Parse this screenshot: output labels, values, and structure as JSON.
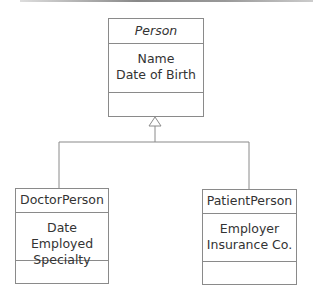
{
  "diagram": {
    "type": "UML class diagram (generalization)",
    "classes": [
      {
        "id": "person",
        "name": "Person",
        "abstract": true,
        "attributes": [
          "Name",
          "Date of Birth"
        ],
        "operations": []
      },
      {
        "id": "doctor",
        "name": "DoctorPerson",
        "abstract": false,
        "attributes": [
          "Date Employed",
          "Specialty"
        ],
        "operations": []
      },
      {
        "id": "patient",
        "name": "PatientPerson",
        "abstract": false,
        "attributes": [
          "Employer",
          "Insurance Co."
        ],
        "operations": []
      }
    ],
    "relationships": [
      {
        "type": "generalization",
        "from": "DoctorPerson",
        "to": "Person"
      },
      {
        "type": "generalization",
        "from": "PatientPerson",
        "to": "Person"
      }
    ],
    "colors": {
      "line": "#8a8a8a",
      "text": "#333333",
      "background": "#ffffff"
    }
  }
}
